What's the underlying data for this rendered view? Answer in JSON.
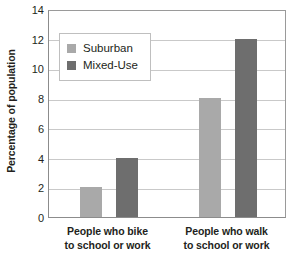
{
  "chart_data": {
    "type": "bar",
    "title": "",
    "xlabel": "",
    "ylabel": "Percentage of population",
    "ylim": [
      0,
      14
    ],
    "yticks": [
      0,
      2,
      4,
      6,
      8,
      10,
      12,
      14
    ],
    "ytick_labels": [
      "0",
      "2",
      "4",
      "6",
      "8",
      "10",
      "12",
      "14"
    ],
    "grid": true,
    "legend_position": "upper left",
    "categories": [
      "People who bike to school or work",
      "People who walk to school or work"
    ],
    "category_lines": [
      [
        "People who bike",
        "to school or work"
      ],
      [
        "People who walk",
        "to school or work"
      ]
    ],
    "series": [
      {
        "name": "Suburban",
        "values": [
          2,
          8
        ],
        "color": "#a9a9a9"
      },
      {
        "name": "Mixed-Use",
        "values": [
          4,
          12
        ],
        "color": "#6e6e6e"
      }
    ]
  },
  "colors": {
    "suburban": "#a9a9a9",
    "mixed_use": "#6e6e6e",
    "gridline": "#c9c9c9",
    "axis": "#8c8c8c",
    "text": "#231f20",
    "legend_border": "#bfbfbf",
    "background": "#ffffff"
  }
}
